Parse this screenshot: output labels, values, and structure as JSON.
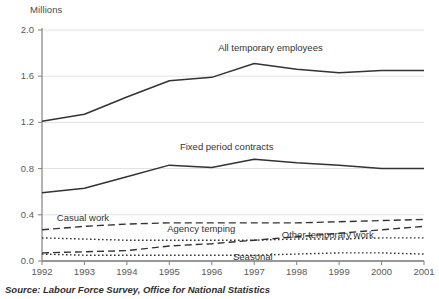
{
  "chart_data": {
    "type": "line",
    "title": "",
    "subtitle": "",
    "ylabel": "Millions",
    "xlabel": "",
    "unit_label": "Millions",
    "x": [
      1992,
      1993,
      1994,
      1995,
      1996,
      1997,
      1998,
      1999,
      2000,
      2001
    ],
    "xtick_labels": [
      "1992",
      "1993",
      "1994",
      "1995",
      "1996",
      "1997",
      "1998",
      "1999",
      "2000",
      "2001"
    ],
    "ytick_labels": [
      "0.0",
      "0.4",
      "0.8",
      "1.2",
      "1.6",
      "2.0"
    ],
    "yticks": [
      0.0,
      0.4,
      0.8,
      1.2,
      1.6,
      2.0
    ],
    "ylim": [
      0.0,
      2.0
    ],
    "xlim": [
      1992,
      2001
    ],
    "grid": true,
    "legend": "inline-annotations",
    "source": "Source: Labour Force Survey, Office for National Statistics",
    "series": [
      {
        "name": "All temporary employees",
        "style": "solid",
        "color": "#333333",
        "label_x": 1996.15,
        "label_y": 1.84,
        "values": [
          1.21,
          1.27,
          1.42,
          1.56,
          1.59,
          1.71,
          1.66,
          1.63,
          1.65,
          1.65
        ]
      },
      {
        "name": "Fixed period contracts",
        "style": "solid",
        "color": "#333333",
        "label_x": 1995.25,
        "label_y": 0.99,
        "values": [
          0.59,
          0.63,
          0.73,
          0.83,
          0.81,
          0.88,
          0.85,
          0.83,
          0.8,
          0.8
        ]
      },
      {
        "name": "Casual work",
        "style": "dashed",
        "color": "#333333",
        "label_x": 1992.35,
        "label_y": 0.37,
        "values": [
          0.27,
          0.3,
          0.32,
          0.33,
          0.33,
          0.33,
          0.33,
          0.34,
          0.35,
          0.36
        ]
      },
      {
        "name": "Agency temping",
        "style": "dashed",
        "color": "#333333",
        "label_x": 1994.95,
        "label_y": 0.275,
        "values": [
          0.07,
          0.08,
          0.09,
          0.13,
          0.15,
          0.18,
          0.21,
          0.24,
          0.27,
          0.3
        ]
      },
      {
        "name": "Other temporary work",
        "style": "dotted",
        "color": "#333333",
        "label_x": 1997.65,
        "label_y": 0.225,
        "values": [
          0.2,
          0.19,
          0.18,
          0.18,
          0.18,
          0.18,
          0.19,
          0.19,
          0.2,
          0.2
        ]
      },
      {
        "name": "Seasonal",
        "style": "dotted",
        "color": "#333333",
        "label_x": 1996.5,
        "label_y": 0.035,
        "values": [
          0.06,
          0.05,
          0.05,
          0.05,
          0.05,
          0.05,
          0.06,
          0.07,
          0.07,
          0.06
        ]
      }
    ]
  },
  "footer": {
    "source": "Source: Labour Force Survey, Office for National Statistics"
  }
}
